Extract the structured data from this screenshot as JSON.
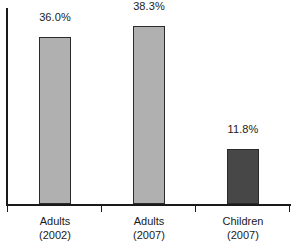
{
  "chart_data": {
    "type": "bar",
    "title": "",
    "subtitle": "",
    "xlabel": "",
    "ylabel": "",
    "categories": [
      "Adults\n(2002)",
      "Adults\n(2007)",
      "Children\n(2007)"
    ],
    "category_lines": [
      [
        "Adults",
        "(2002)"
      ],
      [
        "Adults",
        "(2007)"
      ],
      [
        "Children",
        "(2007)"
      ]
    ],
    "values": [
      36.0,
      38.3,
      11.8
    ],
    "value_labels": [
      "36.0%",
      "38.3%",
      "11.8%"
    ],
    "bar_colors": [
      "#b0b0b0",
      "#b0b0b0",
      "#474747"
    ],
    "bar_border_color": "#2b2b2b",
    "axis_color": "#1a1a1a",
    "ylim": [
      0,
      44
    ],
    "grid": false,
    "legend": null,
    "y_tick_labels": [],
    "annotations": []
  },
  "bars": [
    {
      "category_line1": "Adults",
      "category_line2": "(2002)",
      "value_label": "36.0%",
      "value": 36.0,
      "color": "#b0b0b0"
    },
    {
      "category_line1": "Adults",
      "category_line2": "(2007)",
      "value_label": "38.3%",
      "value": 38.3,
      "color": "#b0b0b0"
    },
    {
      "category_line1": "Children",
      "category_line2": "(2007)",
      "value_label": "11.8%",
      "value": 11.8,
      "color": "#474747"
    }
  ]
}
